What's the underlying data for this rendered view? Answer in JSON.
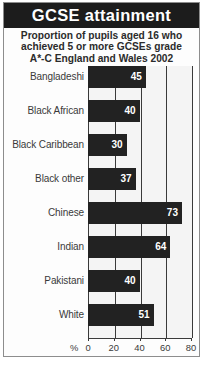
{
  "header": {
    "title": "GCSE attainment",
    "subtitle_lines": [
      "Proportion of pupils aged 16 who",
      "achieved 5 or more GCSEs grade",
      "A*-C England and Wales 2002"
    ]
  },
  "axis": {
    "percent_symbol": "%",
    "tick_labels": [
      "0",
      "20",
      "40",
      "60",
      "80"
    ]
  },
  "colors": {
    "title_bar": "#1c1c1c",
    "title_text": "#ffffff",
    "bar": "#222222",
    "plot_background": "#f4f4f4",
    "gridline": "#3a3a3a",
    "label_text": "#3a3a3a"
  },
  "chart_data": {
    "type": "bar",
    "orientation": "horizontal",
    "title": "GCSE attainment",
    "subtitle": "Proportion of pupils aged 16 who achieved 5 or more GCSEs grade A*-C England and Wales 2002",
    "categories": [
      "Bangladeshi",
      "Black African",
      "Black Caribbean",
      "Black other",
      "Chinese",
      "Indian",
      "Pakistani",
      "White"
    ],
    "values": [
      45,
      40,
      30,
      37,
      73,
      64,
      40,
      51
    ],
    "xlabel": "%",
    "ylabel": "",
    "xlim": [
      0,
      80
    ],
    "xticks": [
      0,
      20,
      40,
      60,
      80
    ],
    "grid": true,
    "legend": false,
    "value_labels": [
      "45",
      "40",
      "30",
      "37",
      "73",
      "64",
      "40",
      "51"
    ]
  }
}
